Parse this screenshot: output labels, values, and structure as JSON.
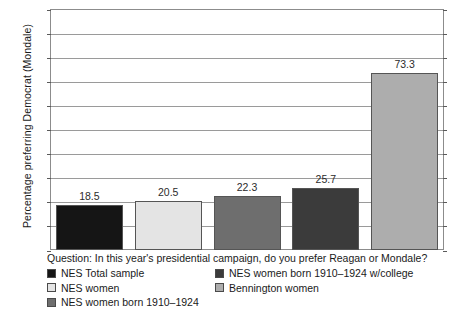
{
  "chart_data": {
    "type": "bar",
    "title": "",
    "xlabel": "",
    "ylabel": "Percentage preferring Democrat (Mondale)",
    "ylim": [
      0,
      100
    ],
    "ytick_step": 10,
    "ytick_labels": [
      "100",
      "90",
      "80",
      "70",
      "60",
      "50",
      "40",
      "30",
      "20",
      "10",
      "0"
    ],
    "grid": true,
    "legend_position": "below-plot",
    "categories": [
      "NES Total sample",
      "NES women",
      "NES women born 1910–1924",
      "NES women born 1910–1924 w/college",
      "Bennington women"
    ],
    "values": [
      18.5,
      20.5,
      22.3,
      25.7,
      73.3
    ],
    "value_labels": [
      "18.5",
      "20.5",
      "22.3",
      "25.7",
      "73.3"
    ],
    "colors": [
      "#151515",
      "#e4e4e4",
      "#6e6e6e",
      "#3b3b3b",
      "#adadad"
    ],
    "caption": "Question: In this year's presidential campaign, do you prefer Reagan or Mondale?"
  },
  "legend": {
    "items": [
      {
        "label": "NES Total sample",
        "color": "#151515"
      },
      {
        "label": "NES women",
        "color": "#e4e4e4"
      },
      {
        "label": "NES women born 1910–1924",
        "color": "#6e6e6e"
      },
      {
        "label": "NES women born 1910–1924 w/college",
        "color": "#3b3b3b"
      },
      {
        "label": "Bennington women",
        "color": "#adadad"
      }
    ]
  }
}
